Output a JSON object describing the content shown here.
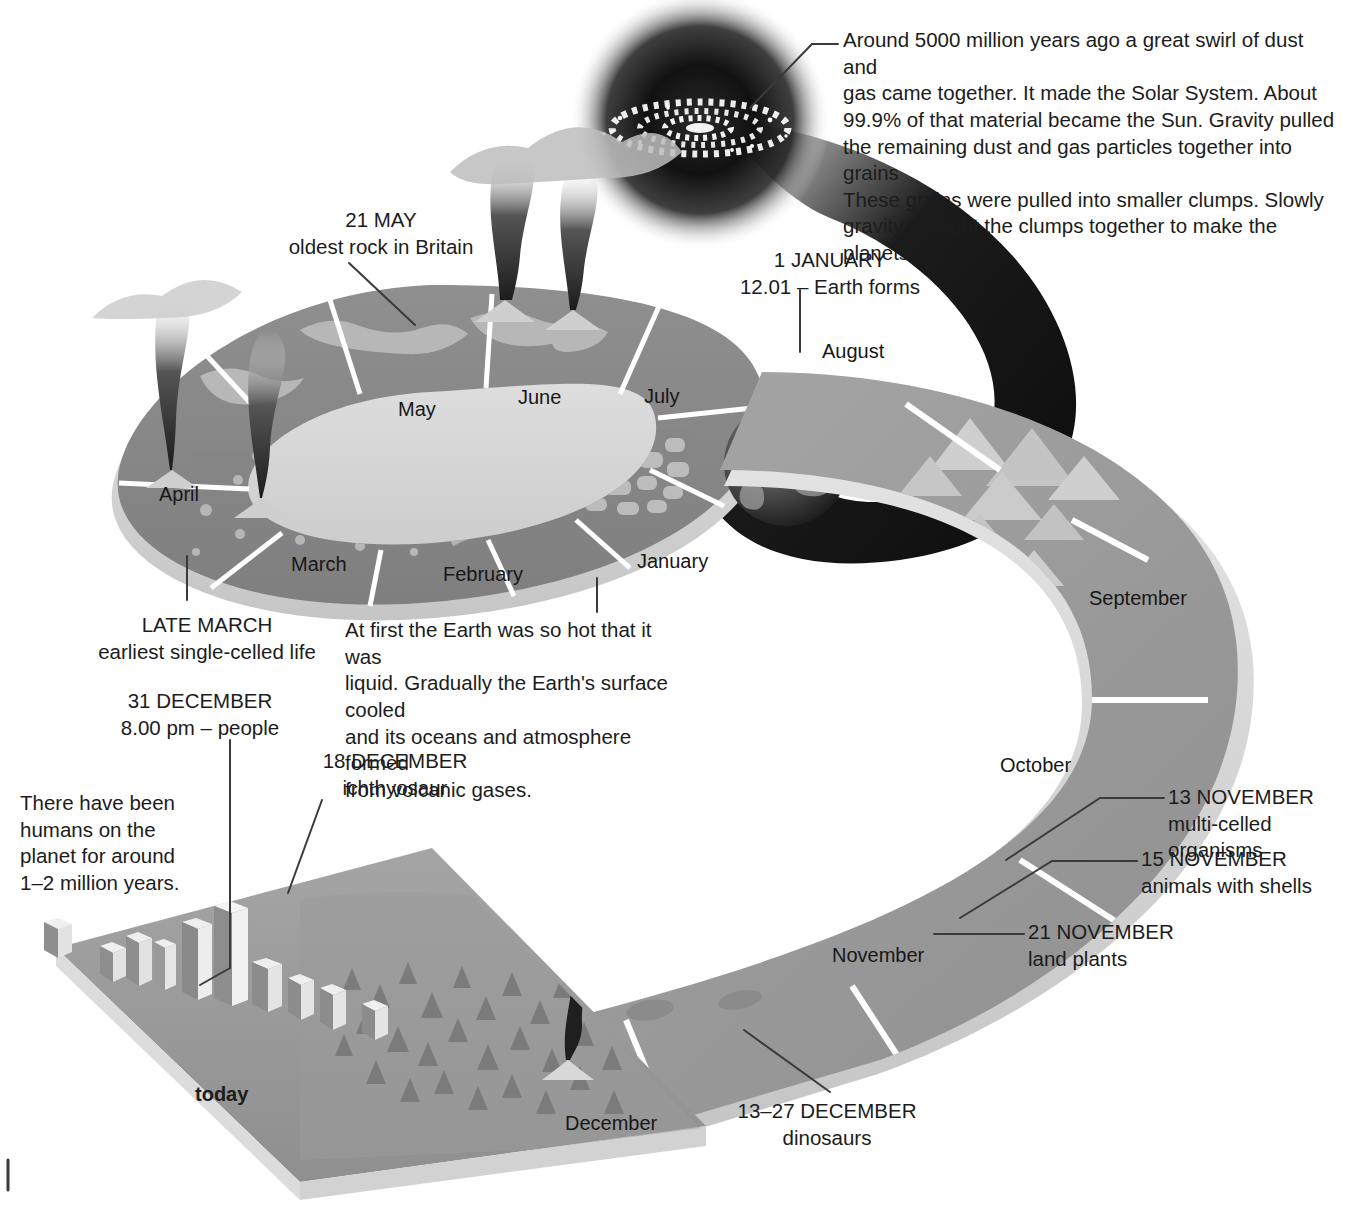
{
  "figure": {
    "type": "infographic-timeline"
  },
  "palette": {
    "background": "#ffffff",
    "ring_top": "#8d8d8d",
    "ring_edge": "#d9d9d9",
    "band_light": "#a8a8a8",
    "band_mid": "#949494",
    "band_edge": "#d6d6d6",
    "dark_sweep": "#111111",
    "text": "#1c1c1c",
    "leader_line": "#3a3a3a",
    "divider": "#ffffff"
  },
  "annotations": [
    {
      "id": "sun",
      "name": "solar-system-formation-note",
      "text": "Around 5000 million years ago a great swirl of dust and\ngas came together. It made the Solar System. About\n99.9% of that material became the Sun. Gravity pulled\nthe remaining dust and gas particles together into grains\nThese grains were pulled into smaller clumps. Slowly\ngravity brought the clumps together to make the planets."
    },
    {
      "id": "may21",
      "name": "oldest-rock-note",
      "date": "21 MAY",
      "caption": "oldest rock in Britain",
      "text": "21 MAY\noldest rock in Britain"
    },
    {
      "id": "jan1",
      "name": "earth-forms-note",
      "date": "1 JANUARY",
      "caption": "12.01 – Earth forms",
      "text": "1 JANUARY\n12.01 – Earth forms"
    },
    {
      "id": "latemarch",
      "name": "earliest-life-note",
      "date": "LATE MARCH",
      "caption": "earliest single-celled life",
      "text": "LATE MARCH\nearliest single-celled life"
    },
    {
      "id": "hot",
      "name": "early-earth-cooling-note",
      "text": "At first the Earth was so hot that it was\nliquid. Gradually the Earth's surface cooled\nand its oceans and atmosphere formed\nfrom volcanic gases."
    },
    {
      "id": "dec31",
      "name": "people-appear-note",
      "date": "31 DECEMBER",
      "caption": "8.00 pm – people",
      "text": "31 DECEMBER\n8.00 pm – people"
    },
    {
      "id": "humans",
      "name": "humans-duration-note",
      "text": "There have been\nhumans on the\nplanet for around\n1–2 million years."
    },
    {
      "id": "dec18",
      "name": "ichthyosaur-note",
      "date": "18 DECEMBER",
      "caption": "ichthyosaur",
      "text": "18 DECEMBER\nichthyosaur"
    },
    {
      "id": "nov13",
      "name": "multi-celled-organisms-note",
      "date": "13 NOVEMBER",
      "caption": "multi-celled organisms",
      "text": "13 NOVEMBER\nmulti-celled organisms"
    },
    {
      "id": "nov15",
      "name": "animals-with-shells-note",
      "date": "15 NOVEMBER",
      "caption": "animals with shells",
      "text": "15 NOVEMBER\nanimals with shells"
    },
    {
      "id": "nov21",
      "name": "land-plants-note",
      "date": "21 NOVEMBER",
      "caption": "land plants",
      "text": "21 NOVEMBER\nland plants"
    },
    {
      "id": "dec1327",
      "name": "dinosaurs-note",
      "date": "13–27 DECEMBER",
      "caption": "dinosaurs",
      "text": "13–27 DECEMBER\ndinosaurs"
    }
  ],
  "months": [
    {
      "id": "january",
      "label": "January"
    },
    {
      "id": "february",
      "label": "February"
    },
    {
      "id": "march",
      "label": "March"
    },
    {
      "id": "april",
      "label": "April"
    },
    {
      "id": "may",
      "label": "May"
    },
    {
      "id": "june",
      "label": "June"
    },
    {
      "id": "july",
      "label": "July"
    },
    {
      "id": "august",
      "label": "August"
    },
    {
      "id": "september",
      "label": "September"
    },
    {
      "id": "october",
      "label": "October"
    },
    {
      "id": "november",
      "label": "November"
    },
    {
      "id": "december",
      "label": "December"
    }
  ],
  "markers": {
    "today": "today"
  }
}
